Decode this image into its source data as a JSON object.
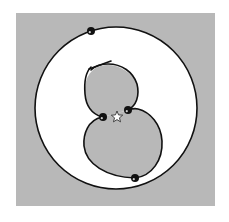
{
  "figure": {
    "colors": {
      "background": "#ffffff",
      "panel": "#b8b8b8",
      "outer_disk_fill": "#ffffff",
      "loop_fill": "#b8b8b8",
      "stroke": "#111111",
      "dot": "#111111",
      "star_fill": "#ffffff",
      "star_stroke": "#333333"
    },
    "panel": {
      "x": 16,
      "y": 13,
      "width": 199,
      "height": 193
    },
    "outer_circle": {
      "cx": 116,
      "cy": 108,
      "r": 81
    },
    "upper_loop_path": "M 91 67 C 86 72, 84 82, 85 94 C 86 106, 92 114, 102 117",
    "upper_loop_right_path": "M 128 110 C 136 106, 140 96, 137 84 C 133 72, 122 64, 108 64 C 101 64, 95 66, 91 70",
    "upper_loop_fill_path": "M 102 117 C 92 114, 86 106, 85 94 C 84 82, 88 70, 100 66 C 114 62, 131 70, 137 84 C 140 96, 136 106, 128 110 Q 115 114 102 117 Z",
    "lower_loop_path": "M 102 117 C 88 120, 83 134, 84 146 C 86 164, 106 177, 135 178 C 152 176, 163 160, 162 141 C 161 124, 150 112, 138 109 C 134 108, 131 109, 128 110",
    "lower_loop_fill_path": "M 102 117 C 88 120, 83 134, 84 146 C 86 164, 106 177, 135 178 C 152 176, 163 160, 162 141 C 161 124, 150 112, 138 109 C 134 108, 131 109, 128 110 Q 115 114 102 117 Z",
    "tail_path": "M 135 178 C 150 183, 170 180, 188 170",
    "tail_path_left": "M 135 178 C 115 183, 85 186, 60 178",
    "crossing_tick": {
      "x1": 89,
      "y1": 69,
      "x2": 111,
      "y2": 61
    },
    "dots": [
      {
        "name": "dot-top",
        "cx": 91,
        "cy": 31,
        "r": 4
      },
      {
        "name": "dot-left-inner",
        "cx": 103,
        "cy": 117,
        "r": 4
      },
      {
        "name": "dot-right-inner",
        "cx": 128,
        "cy": 110,
        "r": 4
      },
      {
        "name": "dot-bottom",
        "cx": 135,
        "cy": 178,
        "r": 4
      }
    ],
    "star": {
      "cx": 117,
      "cy": 117,
      "r_outer": 6,
      "r_inner": 2.6
    }
  }
}
